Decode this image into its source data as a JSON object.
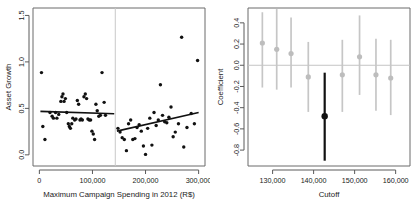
{
  "figure": {
    "panels": [
      "scatter-rd",
      "sensitivity-coefficients"
    ]
  },
  "chart_data": [
    {
      "id": "left",
      "type": "scatter",
      "title": "",
      "xlabel": "Maximum Campaign Spending in 2012 (R$)",
      "ylabel": "Asset Growth",
      "xlim": [
        -12000,
        312000
      ],
      "ylim": [
        -0.12,
        1.58
      ],
      "xticks": [
        0,
        100000,
        200000,
        300000
      ],
      "xticklabels": [
        "0",
        "100,000",
        "200,000",
        "300,000"
      ],
      "yticks": [
        0.0,
        0.5,
        1.0,
        1.5
      ],
      "yticklabels": [
        "0.0",
        "0.5",
        "1.0",
        "1.5"
      ],
      "grid": false,
      "legend": null,
      "cutoff": {
        "x": 143000,
        "label": "cutoff",
        "color": "#c9c9c9"
      },
      "points": [
        [
          4000,
          0.885
        ],
        [
          6500,
          0.305
        ],
        [
          10500,
          0.165
        ],
        [
          20000,
          0.455
        ],
        [
          24000,
          0.415
        ],
        [
          26500,
          0.395
        ],
        [
          30500,
          0.455
        ],
        [
          33000,
          0.395
        ],
        [
          36500,
          0.435
        ],
        [
          40500,
          0.575
        ],
        [
          42500,
          0.625
        ],
        [
          44500,
          0.655
        ],
        [
          46500,
          0.575
        ],
        [
          49000,
          0.605
        ],
        [
          51500,
          0.455
        ],
        [
          54500,
          0.335
        ],
        [
          56500,
          0.305
        ],
        [
          58500,
          0.285
        ],
        [
          61000,
          0.335
        ],
        [
          63000,
          0.395
        ],
        [
          66500,
          0.375
        ],
        [
          69000,
          0.385
        ],
        [
          71500,
          0.585
        ],
        [
          74000,
          0.545
        ],
        [
          76500,
          0.375
        ],
        [
          78500,
          0.385
        ],
        [
          81000,
          0.375
        ],
        [
          84000,
          0.625
        ],
        [
          86500,
          0.655
        ],
        [
          89000,
          0.605
        ],
        [
          91500,
          0.385
        ],
        [
          94000,
          0.375
        ],
        [
          96500,
          0.375
        ],
        [
          99000,
          0.255
        ],
        [
          101500,
          0.225
        ],
        [
          104000,
          0.165
        ],
        [
          106500,
          0.545
        ],
        [
          109000,
          0.475
        ],
        [
          112000,
          0.415
        ],
        [
          115000,
          0.425
        ],
        [
          118000,
          0.885
        ],
        [
          122000,
          0.565
        ],
        [
          124500,
          0.425
        ],
        [
          148000,
          0.285
        ],
        [
          152000,
          0.245
        ],
        [
          156000,
          0.185
        ],
        [
          160000,
          0.165
        ],
        [
          164000,
          0.045
        ],
        [
          168000,
          0.335
        ],
        [
          172000,
          0.375
        ],
        [
          176000,
          0.165
        ],
        [
          180000,
          0.175
        ],
        [
          184000,
          0.295
        ],
        [
          188000,
          0.325
        ],
        [
          192000,
          0.255
        ],
        [
          196000,
          0.095
        ],
        [
          200000,
          0.005
        ],
        [
          204000,
          0.285
        ],
        [
          208000,
          0.395
        ],
        [
          212000,
          0.105
        ],
        [
          216000,
          0.455
        ],
        [
          220000,
          0.315
        ],
        [
          224000,
          0.375
        ],
        [
          228000,
          0.755
        ],
        [
          232000,
          0.425
        ],
        [
          236000,
          0.355
        ],
        [
          240000,
          0.345
        ],
        [
          244000,
          0.405
        ],
        [
          248000,
          0.515
        ],
        [
          252000,
          0.195
        ],
        [
          256000,
          0.245
        ],
        [
          262000,
          0.335
        ],
        [
          268000,
          1.265
        ],
        [
          272000,
          0.085
        ],
        [
          278000,
          0.295
        ],
        [
          286000,
          0.445
        ],
        [
          292000,
          0.335
        ],
        [
          298000,
          1.015
        ]
      ],
      "fit_lines": [
        {
          "side": "left",
          "x1": 2000,
          "y1": 0.468,
          "x2": 141000,
          "y2": 0.442
        },
        {
          "side": "right",
          "x1": 146000,
          "y1": 0.255,
          "x2": 300000,
          "y2": 0.455
        }
      ]
    },
    {
      "id": "right",
      "type": "scatter",
      "title": "",
      "xlabel": "Cutoff",
      "ylabel": "Coefficient",
      "xlim": [
        124000,
        163500
      ],
      "ylim": [
        -0.95,
        0.54
      ],
      "xticks": [
        130000,
        140000,
        150000,
        160000
      ],
      "xticklabels": [
        "130,000",
        "140,000",
        "150,000",
        "160,000"
      ],
      "yticks": [
        0.4,
        0.2,
        0.0,
        -0.2,
        -0.4,
        -0.6,
        -0.8
      ],
      "yticklabels": [
        "0.4",
        "0.2",
        "0.0",
        "-0.2",
        "-0.4",
        "-0.6",
        "-0.8"
      ],
      "grid": false,
      "legend": null,
      "zero_reference": {
        "y": 0.0,
        "color": "#c4c4c4"
      },
      "highlight_color": "#111111",
      "normal_color": "#c6c6c6",
      "estimates": [
        {
          "cutoff": 127500,
          "coefficient": 0.21,
          "ci_low": -0.21,
          "ci_high": 0.5,
          "highlighted": false
        },
        {
          "cutoff": 131000,
          "coefficient": 0.15,
          "ci_low": -0.23,
          "ci_high": 0.53,
          "highlighted": false
        },
        {
          "cutoff": 134500,
          "coefficient": 0.11,
          "ci_low": -0.21,
          "ci_high": 0.45,
          "highlighted": false
        },
        {
          "cutoff": 138700,
          "coefficient": -0.11,
          "ci_low": -0.44,
          "ci_high": 0.22,
          "highlighted": false
        },
        {
          "cutoff": 142700,
          "coefficient": -0.48,
          "ci_low": -0.9,
          "ci_high": -0.07,
          "highlighted": true
        },
        {
          "cutoff": 147000,
          "coefficient": -0.09,
          "ci_low": -0.44,
          "ci_high": 0.24,
          "highlighted": false
        },
        {
          "cutoff": 151200,
          "coefficient": 0.08,
          "ci_low": -0.28,
          "ci_high": 0.47,
          "highlighted": false
        },
        {
          "cutoff": 155200,
          "coefficient": -0.09,
          "ci_low": -0.43,
          "ci_high": 0.25,
          "highlighted": false
        },
        {
          "cutoff": 158800,
          "coefficient": -0.12,
          "ci_low": -0.47,
          "ci_high": 0.24,
          "highlighted": false
        }
      ]
    }
  ]
}
